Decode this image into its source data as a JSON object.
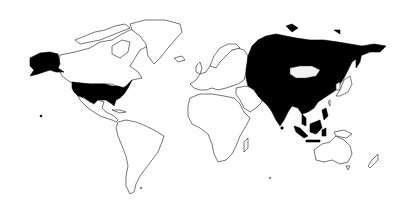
{
  "map": {
    "type": "world-choropleth-binary",
    "projection": "equirectangular-like",
    "background_color": "#ffffff",
    "outline_color": "#3a3a3a",
    "highlight_color": "#000000",
    "unhighlighted_fill": "#ffffff",
    "highlighted_regions": [
      "United States (incl. Alaska)",
      "Russia",
      "Kazakhstan",
      "Uzbekistan",
      "Turkmenistan",
      "Kyrgyzstan",
      "Tajikistan",
      "Afghanistan",
      "Pakistan",
      "China",
      "India",
      "Nepal",
      "Bangladesh",
      "Myanmar",
      "Thailand",
      "Laos",
      "Vietnam",
      "Cambodia",
      "Malaysia",
      "Indonesia",
      "Philippines"
    ],
    "unhighlighted_notable": [
      "Canada",
      "Greenland",
      "Mexico",
      "South America",
      "Europe",
      "Africa",
      "Middle East",
      "Mongolia",
      "Japan",
      "Korea",
      "Australia",
      "New Zealand",
      "Papua New Guinea"
    ]
  }
}
